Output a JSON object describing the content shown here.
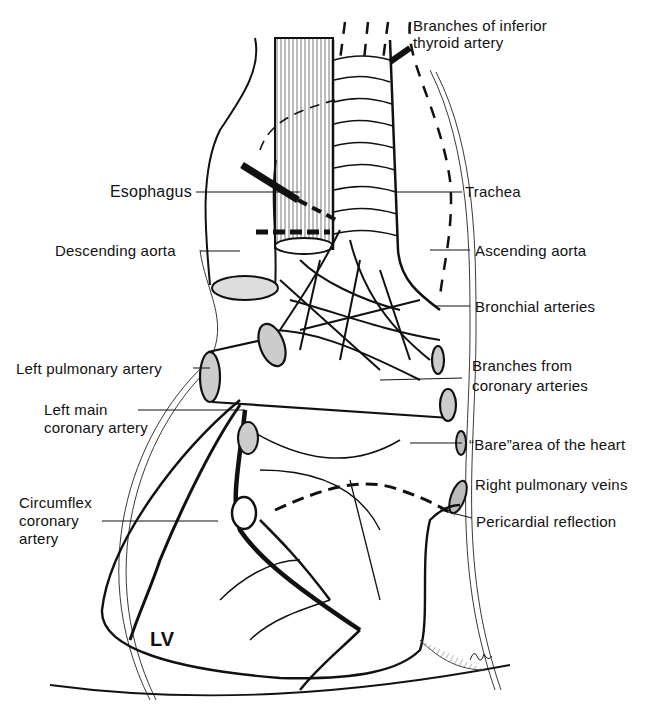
{
  "figure": {
    "chamber_label": "LV",
    "labels": {
      "inferior_thyroid_line1": "Branches of inferior",
      "inferior_thyroid_line2": "thyroid artery",
      "esophagus": "Esophagus",
      "trachea": "Trachea",
      "descending_aorta": "Descending aorta",
      "ascending_aorta": "Ascending aorta",
      "bronchial_arteries": "Bronchial arteries",
      "left_pulmonary_artery": "Left pulmonary artery",
      "branches_coronary_line1": "Branches from",
      "branches_coronary_line2": "coronary arteries",
      "left_main_line1": "Left main",
      "left_main_line2": "coronary artery",
      "bare_area": "“Bare”area of the heart",
      "right_pulmonary_veins": "Right pulmonary veins",
      "circumflex_line1": "Circumflex",
      "circumflex_line2": "coronary",
      "circumflex_line3": "artery",
      "pericardial_reflection": "Pericardial reflection"
    },
    "colors": {
      "ink": "#111111",
      "background": "#ffffff"
    }
  }
}
